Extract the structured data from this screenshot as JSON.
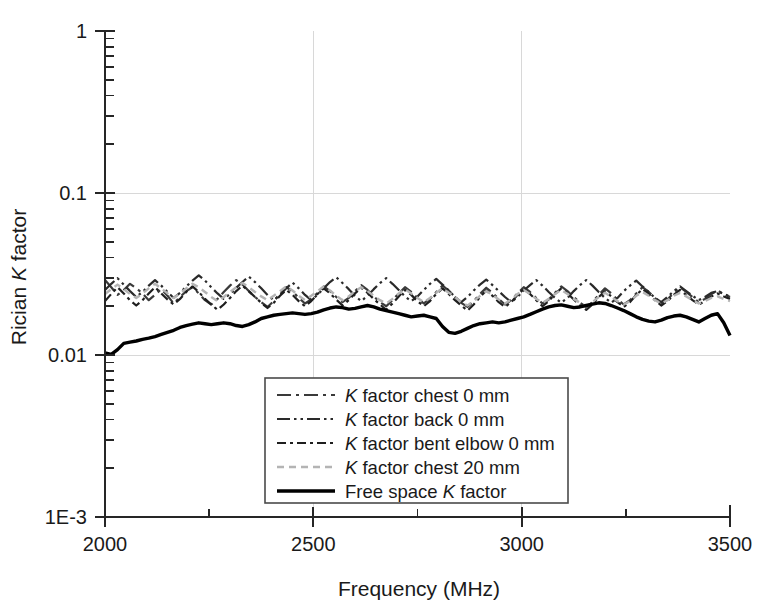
{
  "chart_data": {
    "type": "line",
    "title": "",
    "xlabel": "Frequency (MHz)",
    "ylabel": "Rician K factor",
    "ylabel_parts": {
      "pre": "Rician ",
      "italic": "K",
      "post": " factor"
    },
    "xlim": [
      2000,
      3500
    ],
    "ylim": [
      0.001,
      1
    ],
    "yscale": "log",
    "xscale": "linear",
    "grid": true,
    "grid_color": "#d8d8d8",
    "legend_position": "lower center",
    "x_ticks": [
      "2000",
      "2500",
      "3000",
      "3500"
    ],
    "x_tick_values": [
      2000,
      2500,
      3000,
      3500
    ],
    "x_minor_tick_values": [
      2250,
      2750,
      3250
    ],
    "y_ticks": [
      "1",
      "0.1",
      "0.01",
      "1E-3"
    ],
    "y_tick_values": [
      1,
      0.1,
      0.01,
      0.001
    ],
    "series": [
      {
        "name": "K factor chest 0 mm",
        "label_parts": {
          "italic": "K",
          "rest": " factor chest 0 mm"
        },
        "style": "dash-dot",
        "color": "#3a3a3a",
        "dash": "14,5,3,5",
        "width": 2.2,
        "x": [
          2000,
          2015,
          2030,
          2045,
          2060,
          2075,
          2090,
          2105,
          2120,
          2135,
          2150,
          2165,
          2180,
          2195,
          2210,
          2225,
          2240,
          2255,
          2270,
          2285,
          2300,
          2315,
          2330,
          2345,
          2360,
          2375,
          2390,
          2405,
          2420,
          2435,
          2450,
          2465,
          2480,
          2495,
          2510,
          2525,
          2540,
          2555,
          2570,
          2585,
          2600,
          2615,
          2630,
          2645,
          2660,
          2675,
          2690,
          2705,
          2720,
          2735,
          2750,
          2765,
          2780,
          2795,
          2810,
          2825,
          2840,
          2855,
          2870,
          2885,
          2900,
          2915,
          2930,
          2945,
          2960,
          2975,
          2990,
          3005,
          3020,
          3035,
          3050,
          3065,
          3080,
          3095,
          3110,
          3125,
          3140,
          3155,
          3170,
          3185,
          3200,
          3215,
          3230,
          3245,
          3260,
          3275,
          3290,
          3305,
          3320,
          3335,
          3350,
          3365,
          3380,
          3395,
          3410,
          3425,
          3440,
          3455,
          3470,
          3485,
          3500
        ],
        "y": [
          0.029,
          0.0262,
          0.0235,
          0.0252,
          0.0275,
          0.0258,
          0.024,
          0.0218,
          0.0235,
          0.0255,
          0.0232,
          0.0208,
          0.0228,
          0.0248,
          0.0262,
          0.024,
          0.0218,
          0.0205,
          0.0222,
          0.0245,
          0.0268,
          0.029,
          0.0272,
          0.0248,
          0.0228,
          0.0212,
          0.0198,
          0.0215,
          0.0238,
          0.0262,
          0.0248,
          0.0225,
          0.0208,
          0.022,
          0.0242,
          0.0265,
          0.0248,
          0.0228,
          0.0212,
          0.0225,
          0.0248,
          0.027,
          0.0252,
          0.023,
          0.0212,
          0.02,
          0.0218,
          0.024,
          0.0262,
          0.0245,
          0.0225,
          0.0208,
          0.0222,
          0.0245,
          0.0268,
          0.025,
          0.0228,
          0.021,
          0.0198,
          0.0215,
          0.0238,
          0.026,
          0.0242,
          0.0222,
          0.0205,
          0.0218,
          0.024,
          0.0262,
          0.0245,
          0.0225,
          0.0208,
          0.022,
          0.0242,
          0.0265,
          0.0248,
          0.0228,
          0.021,
          0.0198,
          0.0212,
          0.0235,
          0.0258,
          0.024,
          0.022,
          0.0205,
          0.0218,
          0.024,
          0.0262,
          0.0245,
          0.0225,
          0.0208,
          0.022,
          0.0242,
          0.0262,
          0.0245,
          0.0228,
          0.0212,
          0.0222,
          0.0238,
          0.025,
          0.0238,
          0.0228
        ]
      },
      {
        "name": "K factor back 0 mm",
        "label_parts": {
          "italic": "K",
          "rest": " factor back 0 mm"
        },
        "style": "dash-dot-dot",
        "color": "#2a2a2a",
        "dash": "13,4,2.5,4,2.5,4",
        "width": 2.2,
        "x": [
          2000,
          2015,
          2030,
          2045,
          2060,
          2075,
          2090,
          2105,
          2120,
          2135,
          2150,
          2165,
          2180,
          2195,
          2210,
          2225,
          2240,
          2255,
          2270,
          2285,
          2300,
          2315,
          2330,
          2345,
          2360,
          2375,
          2390,
          2405,
          2420,
          2435,
          2450,
          2465,
          2480,
          2495,
          2510,
          2525,
          2540,
          2555,
          2570,
          2585,
          2600,
          2615,
          2630,
          2645,
          2660,
          2675,
          2690,
          2705,
          2720,
          2735,
          2750,
          2765,
          2780,
          2795,
          2810,
          2825,
          2840,
          2855,
          2870,
          2885,
          2900,
          2915,
          2930,
          2945,
          2960,
          2975,
          2990,
          3005,
          3020,
          3035,
          3050,
          3065,
          3080,
          3095,
          3110,
          3125,
          3140,
          3155,
          3170,
          3185,
          3200,
          3215,
          3230,
          3245,
          3260,
          3275,
          3290,
          3305,
          3320,
          3335,
          3350,
          3365,
          3380,
          3395,
          3410,
          3425,
          3440,
          3455,
          3470,
          3485,
          3500
        ],
        "y": [
          0.0252,
          0.0275,
          0.0298,
          0.0272,
          0.0248,
          0.0228,
          0.0245,
          0.0268,
          0.029,
          0.0268,
          0.0245,
          0.0225,
          0.0242,
          0.0265,
          0.0288,
          0.031,
          0.0288,
          0.0262,
          0.024,
          0.0222,
          0.0238,
          0.026,
          0.0282,
          0.0305,
          0.0282,
          0.0258,
          0.0235,
          0.0218,
          0.0235,
          0.0258,
          0.028,
          0.0258,
          0.0235,
          0.0218,
          0.0235,
          0.0258,
          0.0282,
          0.0302,
          0.0278,
          0.0255,
          0.0232,
          0.0215,
          0.0232,
          0.0255,
          0.0278,
          0.0298,
          0.0275,
          0.0252,
          0.023,
          0.0215,
          0.023,
          0.0252,
          0.0275,
          0.0295,
          0.0272,
          0.025,
          0.0228,
          0.0212,
          0.0228,
          0.025,
          0.0272,
          0.0292,
          0.027,
          0.0248,
          0.0228,
          0.0212,
          0.0228,
          0.025,
          0.027,
          0.029,
          0.0268,
          0.0245,
          0.0225,
          0.021,
          0.0225,
          0.0248,
          0.027,
          0.029,
          0.0268,
          0.0245,
          0.0225,
          0.021,
          0.0225,
          0.0248,
          0.0268,
          0.0288,
          0.0265,
          0.0245,
          0.0225,
          0.0212,
          0.0228,
          0.0248,
          0.0265,
          0.0248,
          0.0232,
          0.0218,
          0.0228,
          0.0242,
          0.0248,
          0.0238,
          0.023
        ]
      },
      {
        "name": "K factor bent elbow 0 mm",
        "label_parts": {
          "italic": "K",
          "rest": " factor bent elbow 0 mm"
        },
        "style": "dash-dot-dash-dot",
        "color": "#1f1f1f",
        "dash": "9,4,3,4,9,4,3,4",
        "width": 2.2,
        "x": [
          2000,
          2015,
          2030,
          2045,
          2060,
          2075,
          2090,
          2105,
          2120,
          2135,
          2150,
          2165,
          2180,
          2195,
          2210,
          2225,
          2240,
          2255,
          2270,
          2285,
          2300,
          2315,
          2330,
          2345,
          2360,
          2375,
          2390,
          2405,
          2420,
          2435,
          2450,
          2465,
          2480,
          2495,
          2510,
          2525,
          2540,
          2555,
          2570,
          2585,
          2600,
          2615,
          2630,
          2645,
          2660,
          2675,
          2690,
          2705,
          2720,
          2735,
          2750,
          2765,
          2780,
          2795,
          2810,
          2825,
          2840,
          2855,
          2870,
          2885,
          2900,
          2915,
          2930,
          2945,
          2960,
          2975,
          2990,
          3005,
          3020,
          3035,
          3050,
          3065,
          3080,
          3095,
          3110,
          3125,
          3140,
          3155,
          3170,
          3185,
          3200,
          3215,
          3230,
          3245,
          3260,
          3275,
          3290,
          3305,
          3320,
          3335,
          3350,
          3365,
          3380,
          3395,
          3410,
          3425,
          3440,
          3455,
          3470,
          3485,
          3500
        ],
        "y": [
          0.0215,
          0.0238,
          0.0262,
          0.024,
          0.0218,
          0.0202,
          0.0218,
          0.024,
          0.0262,
          0.024,
          0.022,
          0.0205,
          0.0222,
          0.0245,
          0.0265,
          0.0245,
          0.0222,
          0.0205,
          0.019,
          0.0205,
          0.0225,
          0.0248,
          0.0268,
          0.0248,
          0.0228,
          0.021,
          0.0195,
          0.021,
          0.0232,
          0.0252,
          0.0235,
          0.0215,
          0.02,
          0.0215,
          0.0238,
          0.0258,
          0.024,
          0.022,
          0.0202,
          0.0218,
          0.024,
          0.026,
          0.0242,
          0.0222,
          0.0205,
          0.019,
          0.0208,
          0.023,
          0.0252,
          0.0235,
          0.0215,
          0.02,
          0.0215,
          0.0238,
          0.0258,
          0.0238,
          0.0218,
          0.0202,
          0.0188,
          0.0205,
          0.0228,
          0.025,
          0.0232,
          0.0212,
          0.0198,
          0.0212,
          0.0235,
          0.0255,
          0.0238,
          0.0218,
          0.02,
          0.0215,
          0.0238,
          0.0258,
          0.024,
          0.022,
          0.0202,
          0.019,
          0.0205,
          0.0228,
          0.0248,
          0.023,
          0.0212,
          0.0198,
          0.0212,
          0.0235,
          0.0255,
          0.0238,
          0.0218,
          0.0202,
          0.0215,
          0.0235,
          0.0252,
          0.0235,
          0.0218,
          0.0205,
          0.0215,
          0.023,
          0.024,
          0.023,
          0.0222
        ]
      },
      {
        "name": "K factor chest 20 mm",
        "label_parts": {
          "italic": "K",
          "rest": " factor chest 20 mm"
        },
        "style": "dotted-light",
        "color": "#b4b4b4",
        "dash": "7,5",
        "width": 2.4,
        "x": [
          2000,
          2015,
          2030,
          2045,
          2060,
          2075,
          2090,
          2105,
          2120,
          2135,
          2150,
          2165,
          2180,
          2195,
          2210,
          2225,
          2240,
          2255,
          2270,
          2285,
          2300,
          2315,
          2330,
          2345,
          2360,
          2375,
          2390,
          2405,
          2420,
          2435,
          2450,
          2465,
          2480,
          2495,
          2510,
          2525,
          2540,
          2555,
          2570,
          2585,
          2600,
          2615,
          2630,
          2645,
          2660,
          2675,
          2690,
          2705,
          2720,
          2735,
          2750,
          2765,
          2780,
          2795,
          2810,
          2825,
          2840,
          2855,
          2870,
          2885,
          2900,
          2915,
          2930,
          2945,
          2960,
          2975,
          2990,
          3005,
          3020,
          3035,
          3050,
          3065,
          3080,
          3095,
          3110,
          3125,
          3140,
          3155,
          3170,
          3185,
          3200,
          3215,
          3230,
          3245,
          3260,
          3275,
          3290,
          3305,
          3320,
          3335,
          3350,
          3365,
          3380,
          3395,
          3410,
          3425,
          3440,
          3455,
          3470,
          3485,
          3500
        ],
        "y": [
          0.0238,
          0.0255,
          0.0272,
          0.0255,
          0.0238,
          0.0225,
          0.024,
          0.0258,
          0.0275,
          0.0258,
          0.024,
          0.0225,
          0.024,
          0.0258,
          0.0275,
          0.0262,
          0.0245,
          0.0228,
          0.0215,
          0.0228,
          0.0245,
          0.0262,
          0.0278,
          0.0262,
          0.0245,
          0.023,
          0.0218,
          0.0232,
          0.0248,
          0.0265,
          0.025,
          0.0232,
          0.0218,
          0.0232,
          0.0248,
          0.0265,
          0.025,
          0.0232,
          0.0218,
          0.023,
          0.0248,
          0.0262,
          0.0248,
          0.0232,
          0.0218,
          0.0208,
          0.0222,
          0.024,
          0.0255,
          0.024,
          0.0225,
          0.0212,
          0.0225,
          0.0242,
          0.0258,
          0.0242,
          0.0228,
          0.0212,
          0.0202,
          0.0215,
          0.0232,
          0.0248,
          0.0235,
          0.022,
          0.0208,
          0.022,
          0.0238,
          0.0252,
          0.0238,
          0.0222,
          0.021,
          0.0222,
          0.0238,
          0.0252,
          0.0238,
          0.0222,
          0.021,
          0.02,
          0.0212,
          0.0228,
          0.0242,
          0.0228,
          0.0215,
          0.0205,
          0.0215,
          0.0232,
          0.0245,
          0.0232,
          0.0218,
          0.0208,
          0.0218,
          0.0232,
          0.0242,
          0.023,
          0.0218,
          0.0208,
          0.0215,
          0.0225,
          0.023,
          0.0222,
          0.0215
        ]
      },
      {
        "name": "Free space K factor",
        "label_parts": {
          "pre": "Free space ",
          "italic": "K",
          "rest": " factor"
        },
        "style": "solid",
        "color": "#000000",
        "dash": "",
        "width": 3.4,
        "x": [
          2000,
          2015,
          2030,
          2045,
          2060,
          2075,
          2090,
          2105,
          2120,
          2135,
          2150,
          2165,
          2180,
          2195,
          2210,
          2225,
          2240,
          2255,
          2270,
          2285,
          2300,
          2315,
          2330,
          2345,
          2360,
          2375,
          2390,
          2405,
          2420,
          2435,
          2450,
          2465,
          2480,
          2495,
          2510,
          2525,
          2540,
          2555,
          2570,
          2585,
          2600,
          2615,
          2630,
          2645,
          2660,
          2675,
          2690,
          2705,
          2720,
          2735,
          2750,
          2765,
          2780,
          2795,
          2810,
          2825,
          2840,
          2855,
          2870,
          2885,
          2900,
          2915,
          2930,
          2945,
          2960,
          2975,
          2990,
          3005,
          3020,
          3035,
          3050,
          3065,
          3080,
          3095,
          3110,
          3125,
          3140,
          3155,
          3170,
          3185,
          3200,
          3215,
          3230,
          3245,
          3260,
          3275,
          3290,
          3305,
          3320,
          3335,
          3350,
          3365,
          3380,
          3395,
          3410,
          3425,
          3440,
          3455,
          3470,
          3485,
          3500
        ],
        "y": [
          0.0103,
          0.0101,
          0.0108,
          0.0118,
          0.012,
          0.0122,
          0.0125,
          0.0127,
          0.013,
          0.0134,
          0.0138,
          0.0142,
          0.0148,
          0.0152,
          0.0155,
          0.0158,
          0.0156,
          0.0154,
          0.0156,
          0.0158,
          0.0156,
          0.0152,
          0.015,
          0.0154,
          0.016,
          0.0168,
          0.0172,
          0.0176,
          0.0178,
          0.018,
          0.0182,
          0.018,
          0.0178,
          0.018,
          0.0184,
          0.019,
          0.0195,
          0.0198,
          0.0196,
          0.0192,
          0.0194,
          0.0198,
          0.0202,
          0.0198,
          0.0192,
          0.0188,
          0.0184,
          0.018,
          0.0176,
          0.0172,
          0.0174,
          0.0176,
          0.0172,
          0.0168,
          0.015,
          0.0138,
          0.0136,
          0.014,
          0.0146,
          0.0152,
          0.0156,
          0.0158,
          0.016,
          0.0158,
          0.016,
          0.0164,
          0.0168,
          0.0172,
          0.0178,
          0.0185,
          0.0192,
          0.0198,
          0.0202,
          0.0204,
          0.02,
          0.0196,
          0.0198,
          0.0202,
          0.0206,
          0.021,
          0.0208,
          0.0202,
          0.0195,
          0.0188,
          0.018,
          0.0172,
          0.0166,
          0.0162,
          0.016,
          0.0164,
          0.017,
          0.0174,
          0.0176,
          0.0172,
          0.0166,
          0.016,
          0.0168,
          0.0176,
          0.018,
          0.0158,
          0.0132
        ]
      }
    ]
  },
  "axes": {
    "x_axis_label": "Frequency (MHz)",
    "y_axis_label": "Rician K factor"
  }
}
